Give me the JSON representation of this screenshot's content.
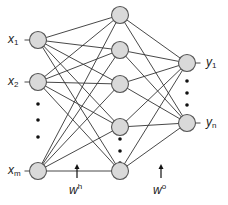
{
  "diagram": {
    "type": "neural-network",
    "colors": {
      "node_fill": "#d9d9d9",
      "node_stroke": "#555555",
      "edge": "#333333",
      "text": "#222222"
    },
    "node_radius": 8.5,
    "layers": {
      "input": {
        "x": 38,
        "nodes": [
          {
            "y": 40,
            "label_base": "x",
            "label_sub": "1"
          },
          {
            "y": 82,
            "label_base": "x",
            "label_sub": "2"
          },
          {
            "y": 171,
            "label_base": "x",
            "label_sub": "m"
          }
        ],
        "ellipsis_dots_y": [
          104,
          120,
          137
        ]
      },
      "hidden": {
        "x": 120,
        "nodes": [
          {
            "y": 15
          },
          {
            "y": 50
          },
          {
            "y": 84
          },
          {
            "y": 127
          },
          {
            "y": 171
          }
        ],
        "ellipsis_dots_y": [
          139,
          151,
          163
        ]
      },
      "output": {
        "x": 187,
        "nodes": [
          {
            "y": 63,
            "label_base": "y",
            "label_sub": "1"
          },
          {
            "y": 123,
            "label_base": "y",
            "label_sub": "n"
          }
        ],
        "ellipsis_dots_y": [
          81,
          93,
          105
        ]
      }
    },
    "weights": {
      "hidden": {
        "base": "w",
        "sup": "h",
        "arrow_x": 77,
        "arrow_top": 164,
        "arrow_bottom": 178
      },
      "output": {
        "base": "w",
        "sup": "o",
        "arrow_x": 161,
        "arrow_top": 164,
        "arrow_bottom": 178
      }
    }
  }
}
